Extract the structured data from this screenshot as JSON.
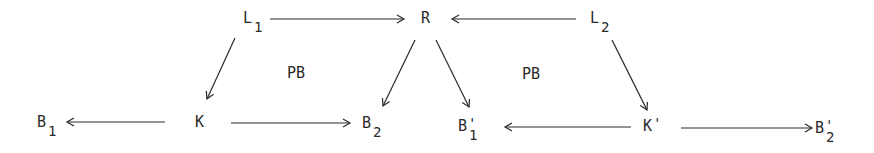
{
  "diagram": {
    "type": "commutative-diagram",
    "colors": {
      "ink": "#2a2a2a",
      "background": "#ffffff"
    },
    "nodes": [
      {
        "id": "L1",
        "base": "L",
        "sub": "1",
        "prime": "",
        "x": 243,
        "y": 23
      },
      {
        "id": "R",
        "base": "R",
        "sub": "",
        "prime": "",
        "x": 421,
        "y": 23
      },
      {
        "id": "L2",
        "base": "L",
        "sub": "2",
        "prime": "",
        "x": 590,
        "y": 23
      },
      {
        "id": "B1",
        "base": "B",
        "sub": "1",
        "prime": "",
        "x": 37,
        "y": 127
      },
      {
        "id": "K",
        "base": "K",
        "sub": "",
        "prime": "",
        "x": 195,
        "y": 127
      },
      {
        "id": "B2",
        "base": "B",
        "sub": "2",
        "prime": "",
        "x": 362,
        "y": 128
      },
      {
        "id": "B1p",
        "base": "B",
        "sub": "1",
        "prime": "'",
        "x": 458,
        "y": 131
      },
      {
        "id": "Kp",
        "base": "K",
        "sub": "",
        "prime": "'",
        "x": 643,
        "y": 131
      },
      {
        "id": "B2p",
        "base": "B",
        "sub": "2",
        "prime": "'",
        "x": 815,
        "y": 133
      }
    ],
    "edges": [
      {
        "name": "arrow-L1-to-R",
        "from": "L1",
        "to": "R",
        "x1": 270,
        "y1": 19,
        "x2": 404,
        "y2": 19
      },
      {
        "name": "arrow-L2-to-R",
        "from": "L2",
        "to": "R",
        "x1": 576,
        "y1": 19,
        "x2": 452,
        "y2": 19
      },
      {
        "name": "arrow-L1-to-K",
        "from": "L1",
        "to": "K",
        "x1": 235,
        "y1": 38,
        "x2": 207,
        "y2": 99
      },
      {
        "name": "arrow-R-to-B2",
        "from": "R",
        "to": "B2",
        "x1": 415,
        "y1": 40,
        "x2": 383,
        "y2": 106
      },
      {
        "name": "arrow-R-to-B1p",
        "from": "R",
        "to": "B1p",
        "x1": 436,
        "y1": 40,
        "x2": 469,
        "y2": 107
      },
      {
        "name": "arrow-L2-to-Kp",
        "from": "L2",
        "to": "Kp",
        "x1": 612,
        "y1": 40,
        "x2": 647,
        "y2": 110
      },
      {
        "name": "arrow-K-to-B1",
        "from": "K",
        "to": "B1",
        "x1": 165,
        "y1": 122,
        "x2": 67,
        "y2": 122
      },
      {
        "name": "arrow-K-to-B2",
        "from": "K",
        "to": "B2",
        "x1": 231,
        "y1": 123,
        "x2": 350,
        "y2": 123
      },
      {
        "name": "arrow-Kp-to-B1p",
        "from": "Kp",
        "to": "B1p",
        "x1": 631,
        "y1": 127,
        "x2": 505,
        "y2": 127
      },
      {
        "name": "arrow-Kp-to-B2p",
        "from": "Kp",
        "to": "B2p",
        "x1": 681,
        "y1": 128,
        "x2": 812,
        "y2": 128
      }
    ],
    "annotations": [
      {
        "name": "pushout-label-left",
        "text": "PB",
        "x": 287,
        "y": 78
      },
      {
        "name": "pushout-label-right",
        "text": "PB",
        "x": 522,
        "y": 79
      }
    ]
  }
}
